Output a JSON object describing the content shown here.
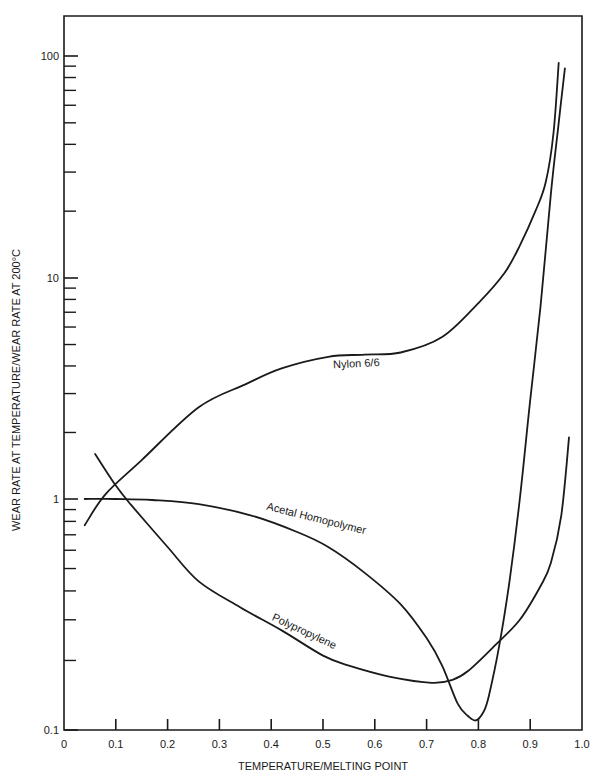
{
  "chart_data": {
    "type": "line",
    "title": "",
    "xlabel": "TEMPERATURE/MELTING POINT",
    "ylabel": "WEAR RATE AT TEMPERATURE/WEAR RATE AT 200°C",
    "xlim": [
      0,
      1.0
    ],
    "ylim": [
      0.1,
      100
    ],
    "yscale": "log",
    "grid": false,
    "legend": "inline labels on curves",
    "x_ticks": [
      "0",
      "0.1",
      "0.2",
      "0.3",
      "0.4",
      "0.5",
      "0.6",
      "0.7",
      "0.8",
      "0.9",
      "1.0"
    ],
    "y_ticks": [
      "0.1",
      "1",
      "10",
      "100"
    ],
    "series": [
      {
        "name": "Nylon 6/6",
        "label_pos": [
          0.52,
          3.9
        ],
        "label_angle": -3,
        "x": [
          0.04,
          0.08,
          0.15,
          0.26,
          0.35,
          0.42,
          0.51,
          0.58,
          0.65,
          0.73,
          0.8,
          0.85,
          0.88,
          0.91,
          0.93,
          0.945,
          0.955
        ],
        "y": [
          0.77,
          1.05,
          1.5,
          2.6,
          3.3,
          3.9,
          4.4,
          4.5,
          4.6,
          5.4,
          7.7,
          10.5,
          14,
          20,
          27,
          45,
          93
        ]
      },
      {
        "name": "Acetal Homopolymer",
        "label_pos": [
          0.39,
          0.9
        ],
        "label_angle": 14,
        "x": [
          0.04,
          0.1,
          0.17,
          0.26,
          0.36,
          0.45,
          0.51,
          0.58,
          0.65,
          0.7,
          0.73,
          0.76,
          0.78,
          0.795,
          0.81,
          0.82,
          0.84,
          0.86,
          0.88,
          0.9,
          0.92,
          0.94,
          0.955,
          0.967
        ],
        "y": [
          1.0,
          1.0,
          0.99,
          0.95,
          0.85,
          0.72,
          0.62,
          0.48,
          0.35,
          0.25,
          0.19,
          0.13,
          0.115,
          0.11,
          0.12,
          0.14,
          0.23,
          0.44,
          1.0,
          2.8,
          7.5,
          24,
          50,
          88
        ]
      },
      {
        "name": "Polypropylene",
        "label_pos": [
          0.4,
          0.3
        ],
        "label_angle": 25,
        "x": [
          0.06,
          0.1,
          0.13,
          0.2,
          0.26,
          0.34,
          0.42,
          0.5,
          0.55,
          0.63,
          0.71,
          0.75,
          0.78,
          0.83,
          0.88,
          0.92,
          0.94,
          0.96,
          0.975
        ],
        "y": [
          1.6,
          1.15,
          0.94,
          0.62,
          0.44,
          0.34,
          0.27,
          0.21,
          0.19,
          0.17,
          0.16,
          0.165,
          0.18,
          0.23,
          0.3,
          0.42,
          0.53,
          0.85,
          1.9
        ]
      }
    ]
  }
}
